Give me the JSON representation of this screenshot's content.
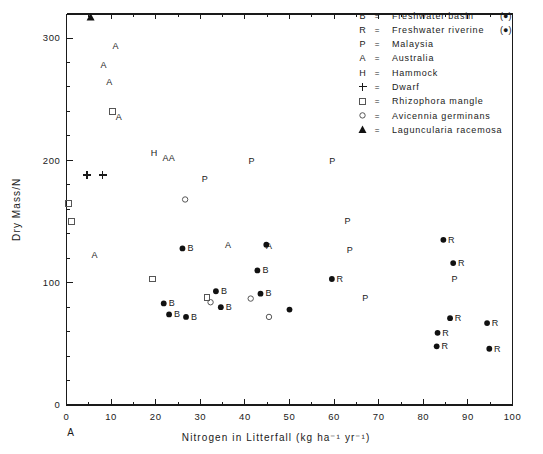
{
  "figure": {
    "panel_label": "A",
    "background": "#ffffff",
    "foreground": "#1a1a1a"
  },
  "chart_data": {
    "type": "scatter",
    "title": "",
    "subtitle": "",
    "xlabel": "Nitrogen in Litterfall  (kg ha⁻¹ yr⁻¹)",
    "ylabel": "Dry Mass/N",
    "xlim": [
      0,
      100
    ],
    "ylim": [
      0,
      320
    ],
    "xticks": [
      0,
      10,
      20,
      30,
      40,
      50,
      60,
      70,
      80,
      90,
      100
    ],
    "xticklabels": [
      "0",
      "10",
      "20",
      "30",
      "40",
      "50",
      "60",
      "70",
      "80",
      "90",
      "100"
    ],
    "x_minor_interval": 5,
    "yticks": [
      100,
      200,
      300
    ],
    "yticklabels": [
      "100",
      "200",
      "300"
    ],
    "y_minor_interval": 20,
    "grid": false,
    "legend_position": "top-right",
    "legend": [
      {
        "symbol": "B",
        "symbol_kind": "text",
        "equals": "=",
        "label": "Freshwater basin",
        "note": "(●)"
      },
      {
        "symbol": "R",
        "symbol_kind": "text",
        "equals": "=",
        "label": "Freshwater riverine",
        "note": "(●)"
      },
      {
        "symbol": "P",
        "symbol_kind": "text",
        "equals": "=",
        "label": "Malaysia",
        "note": ""
      },
      {
        "symbol": "A",
        "symbol_kind": "text",
        "equals": "=",
        "label": "Australia",
        "note": ""
      },
      {
        "symbol": "H",
        "symbol_kind": "text",
        "equals": "=",
        "label": "Hammock",
        "note": ""
      },
      {
        "symbol": "+",
        "symbol_kind": "plus",
        "equals": "=",
        "label": "Dwarf",
        "note": ""
      },
      {
        "symbol": "□",
        "symbol_kind": "square-open",
        "equals": "=",
        "label": "Rhizophora mangle",
        "note": ""
      },
      {
        "symbol": "○",
        "symbol_kind": "circle-open",
        "equals": "=",
        "label": "Avicennia germinans",
        "note": ""
      },
      {
        "symbol": "▲",
        "symbol_kind": "triangle-filled",
        "equals": "=",
        "label": "Laguncularia racemosa",
        "note": ""
      }
    ],
    "series": [
      {
        "name": "Freshwater basin",
        "marker": "filled-circle",
        "letter": "B",
        "points": [
          {
            "x": 26.0,
            "y": 128
          },
          {
            "x": 21.8,
            "y": 83
          },
          {
            "x": 23.0,
            "y": 74
          },
          {
            "x": 26.8,
            "y": 72
          },
          {
            "x": 33.5,
            "y": 93
          },
          {
            "x": 34.6,
            "y": 80
          },
          {
            "x": 42.8,
            "y": 110
          },
          {
            "x": 43.5,
            "y": 91
          }
        ]
      },
      {
        "name": "Freshwater riverine",
        "marker": "filled-circle",
        "letter": "R",
        "points": [
          {
            "x": 59.5,
            "y": 103
          },
          {
            "x": 84.5,
            "y": 135
          },
          {
            "x": 86.7,
            "y": 116
          },
          {
            "x": 86.0,
            "y": 71
          },
          {
            "x": 83.2,
            "y": 59
          },
          {
            "x": 83.0,
            "y": 48
          },
          {
            "x": 94.3,
            "y": 67
          },
          {
            "x": 94.8,
            "y": 46
          }
        ]
      },
      {
        "name": "Malaysia",
        "marker": "text-P",
        "letter": "P",
        "points": [
          {
            "x": 31.0,
            "y": 185
          },
          {
            "x": 41.5,
            "y": 200
          },
          {
            "x": 59.6,
            "y": 200
          },
          {
            "x": 63.0,
            "y": 151
          },
          {
            "x": 63.5,
            "y": 127
          },
          {
            "x": 67.0,
            "y": 88
          },
          {
            "x": 87.0,
            "y": 103
          }
        ]
      },
      {
        "name": "Australia",
        "marker": "text-A",
        "letter": "A",
        "points": [
          {
            "x": 11.0,
            "y": 294
          },
          {
            "x": 8.3,
            "y": 278
          },
          {
            "x": 9.6,
            "y": 264
          },
          {
            "x": 11.7,
            "y": 236
          },
          {
            "x": 6.3,
            "y": 123
          },
          {
            "x": 22.2,
            "y": 202
          },
          {
            "x": 23.6,
            "y": 202
          },
          {
            "x": 36.2,
            "y": 131
          },
          {
            "x": 45.4,
            "y": 130
          }
        ]
      },
      {
        "name": "Hammock",
        "marker": "text-H",
        "letter": "H",
        "points": [
          {
            "x": 19.6,
            "y": 206
          }
        ]
      },
      {
        "name": "Dwarf",
        "marker": "plus",
        "letter": "+",
        "points": [
          {
            "x": 4.6,
            "y": 188
          },
          {
            "x": 8.1,
            "y": 188
          }
        ]
      },
      {
        "name": "Rhizophora mangle",
        "marker": "open-square",
        "letter": "",
        "points": [
          {
            "x": 10.3,
            "y": 240
          },
          {
            "x": 0.4,
            "y": 165
          },
          {
            "x": 1.2,
            "y": 150
          },
          {
            "x": 19.2,
            "y": 103
          },
          {
            "x": 31.5,
            "y": 88
          }
        ]
      },
      {
        "name": "Avicennia germinans",
        "marker": "open-circle",
        "letter": "",
        "points": [
          {
            "x": 26.6,
            "y": 168
          },
          {
            "x": 32.3,
            "y": 84
          },
          {
            "x": 41.3,
            "y": 87
          },
          {
            "x": 45.4,
            "y": 72
          }
        ]
      },
      {
        "name": "Laguncularia racemosa",
        "marker": "filled-triangle",
        "letter": "",
        "points": [
          {
            "x": 5.4,
            "y": 317
          }
        ]
      },
      {
        "name": "Unlabeled filled circles",
        "marker": "filled-circle",
        "letter": "",
        "points": [
          {
            "x": 44.8,
            "y": 131
          },
          {
            "x": 50.0,
            "y": 78
          }
        ]
      }
    ]
  }
}
